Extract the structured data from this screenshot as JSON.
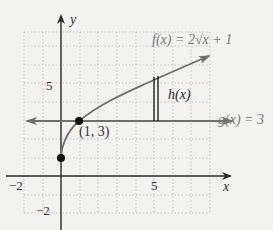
{
  "figure": {
    "axes": {
      "x_label": "x",
      "y_label": "y",
      "x_range": [
        -2,
        8
      ],
      "y_range": [
        -2,
        8
      ],
      "x_ticks": [
        {
          "value": -2,
          "label": "−2"
        },
        {
          "value": 5,
          "label": "5"
        }
      ],
      "y_ticks": [
        {
          "value": 5,
          "label": "5"
        },
        {
          "value": -2,
          "label": "−2"
        }
      ],
      "grid": "dotted, 1 unit spacing"
    },
    "curves": [
      {
        "name": "f",
        "label": "f(x) = 2√x + 1",
        "color": "#6e6e6e"
      },
      {
        "name": "g",
        "label": "g(x) = 3",
        "color": "#6e6e6e"
      }
    ],
    "points": [
      {
        "x": 0,
        "y": 1,
        "label": ""
      },
      {
        "x": 1,
        "y": 3,
        "label": "(1, 3)"
      }
    ],
    "segment": {
      "label": "h(x)",
      "x": 4.7
    }
  },
  "colors": {
    "background": "#f3f2ef",
    "grid": "#b9b9b9",
    "axis": "#2a2a2a",
    "curve": "#6e6e6e",
    "text": "#333333"
  }
}
